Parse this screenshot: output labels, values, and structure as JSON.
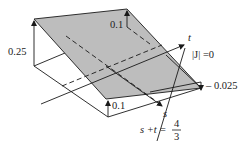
{
  "diagram": {
    "colors": {
      "plane_fill": "#bdbdbd",
      "line": "#1a1a1a",
      "background": "#ffffff"
    },
    "labels": {
      "height_back_left": "0.25",
      "height_back_right": "0.1",
      "height_front_left": "0.1",
      "height_front_right": "– 0.025",
      "axis_t": "t",
      "axis_s": "s",
      "jacobian_zero": "|J| =0",
      "constraint_lhs": "s +t =",
      "constraint_num": "4",
      "constraint_den": "3"
    }
  }
}
